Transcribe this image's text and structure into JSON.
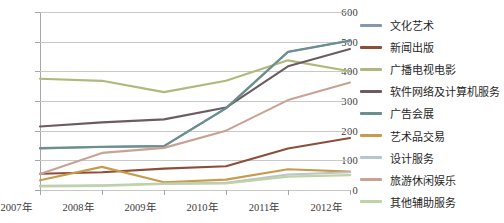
{
  "chart_data": {
    "type": "line",
    "title": "",
    "xlabel": "",
    "ylabel": "",
    "x": [
      "2007年",
      "2008年",
      "2009年",
      "2010年",
      "2011年",
      "2012年"
    ],
    "categories": [
      "2007年",
      "2008年",
      "2009年",
      "2010年",
      "2011年",
      "2012年"
    ],
    "ylim": [
      0,
      600
    ],
    "yticks": [
      0,
      100,
      200,
      300,
      400,
      500,
      600
    ],
    "ytick_labels": [
      "0",
      "100",
      "200",
      "300",
      "400",
      "500",
      "600"
    ],
    "grid": true,
    "legend_position": "right",
    "series": [
      {
        "name": "文化艺术",
        "color": "#8497B0",
        "values": [
          140,
          145,
          148,
          275,
          465,
          503
        ]
      },
      {
        "name": "新闻出版",
        "color": "#8C4E38",
        "values": [
          55,
          60,
          72,
          80,
          140,
          175
        ]
      },
      {
        "name": "广播电视电影",
        "color": "#AFB97A",
        "values": [
          375,
          368,
          330,
          368,
          437,
          400
        ]
      },
      {
        "name": "软件网络及计算机服务",
        "color": "#6B5B63",
        "values": [
          214,
          228,
          238,
          278,
          417,
          475
        ]
      },
      {
        "name": "广告会展",
        "color": "#6A8F8C",
        "values": [
          141,
          146,
          148,
          276,
          466,
          504
        ]
      },
      {
        "name": "艺术品交易",
        "color": "#C89B4A",
        "values": [
          33,
          78,
          26,
          35,
          70,
          62
        ]
      },
      {
        "name": "设计服务",
        "color": "#B9C4CE",
        "values": [
          14,
          16,
          22,
          24,
          52,
          60
        ]
      },
      {
        "name": "旅游休闲娱乐",
        "color": "#C9A293",
        "values": [
          54,
          125,
          142,
          200,
          303,
          362
        ]
      },
      {
        "name": "其他辅助服务",
        "color": "#BFD3A3",
        "values": [
          12,
          14,
          20,
          22,
          45,
          50
        ]
      }
    ]
  },
  "legend": {
    "items": [
      {
        "label": "文化艺术"
      },
      {
        "label": "新闻出版"
      },
      {
        "label": "广播电视电影"
      },
      {
        "label": "软件网络及计算机服务"
      },
      {
        "label": "广告会展"
      },
      {
        "label": "艺术品交易"
      },
      {
        "label": "设计服务"
      },
      {
        "label": "旅游休闲娱乐"
      },
      {
        "label": "其他辅助服务"
      }
    ]
  }
}
